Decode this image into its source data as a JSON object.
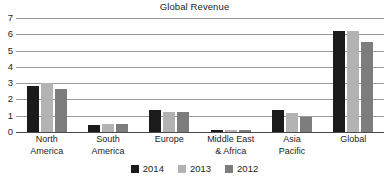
{
  "chart_data": {
    "type": "bar",
    "title": "Global Revenue",
    "xlabel": "",
    "ylabel": "",
    "ylim": [
      0,
      7
    ],
    "yticks": [
      0,
      1,
      2,
      3,
      4,
      5,
      6,
      7
    ],
    "grid": true,
    "legend_position": "bottom-center",
    "categories": [
      "North America",
      "South America",
      "Europe",
      "Middle East & Africa",
      "Asia Pacific",
      "Global"
    ],
    "category_lines": [
      [
        "North",
        "America"
      ],
      [
        "South",
        "America"
      ],
      [
        "Europe",
        ""
      ],
      [
        "Middle East",
        "& Africa"
      ],
      [
        "Asia",
        "Pacific"
      ],
      [
        "Global",
        ""
      ]
    ],
    "series": [
      {
        "name": "2014",
        "color": "#1b1b1b",
        "values": [
          2.85,
          0.45,
          1.35,
          0.15,
          1.35,
          6.2
        ]
      },
      {
        "name": "2013",
        "color": "#b3b3b3",
        "values": [
          3.0,
          0.5,
          1.25,
          0.1,
          1.15,
          6.2
        ]
      },
      {
        "name": "2012",
        "color": "#7d7d7d",
        "values": [
          2.65,
          0.5,
          1.25,
          0.15,
          0.9,
          5.5
        ]
      }
    ]
  },
  "legend": {
    "items": [
      {
        "label": "2014",
        "color": "#1b1b1b"
      },
      {
        "label": "2013",
        "color": "#b3b3b3"
      },
      {
        "label": "2012",
        "color": "#7d7d7d"
      }
    ]
  },
  "axis": {
    "y_tick_labels": [
      "7",
      "6",
      "5",
      "4",
      "3",
      "2",
      "1",
      "0"
    ]
  }
}
